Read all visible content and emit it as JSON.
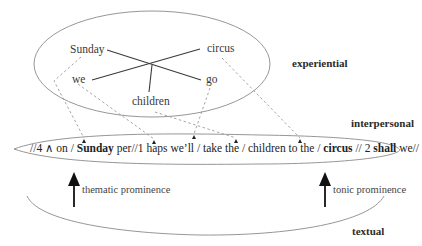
{
  "diagram": {
    "experiential": {
      "label": "experiential",
      "words": {
        "sunday": "Sunday",
        "circus": "circus",
        "we": "we",
        "go": "go",
        "children": "children"
      }
    },
    "interpersonal": {
      "label": "interpersonal",
      "utterance": {
        "seg1": "//4 ∧ on / ",
        "seg2_bold": "Sunday",
        "seg3": " per//1 haps we’ll / take the / children to the / ",
        "seg4_bold": "circus",
        "seg5": " // 2 ",
        "seg6_bold": "shall",
        "seg7": " we//"
      }
    },
    "textual": {
      "label": "textual",
      "thematic": "thematic prominence",
      "tonic": "tonic prominence"
    },
    "colors": {
      "ellipse": "#8a8a8a",
      "cross_lines": "#3a3a3a",
      "dashed": "#9a9a9a",
      "arrows": "#111111"
    }
  }
}
